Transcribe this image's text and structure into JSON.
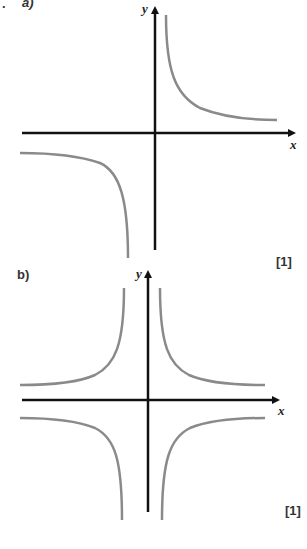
{
  "parts": [
    {
      "label": "a)",
      "prefix": ".",
      "marks": "[1]",
      "x_axis_label": "x",
      "y_axis_label": "y",
      "description": "Rectangular hyperbola y = k/x with branches in first and third quadrants"
    },
    {
      "label": "b)",
      "marks": "[1]",
      "x_axis_label": "x",
      "y_axis_label": "y",
      "description": "Graph with vertical asymptote at x=0; four branches, one in each quadrant approaching horizontal asymptotes above and below the x-axis"
    }
  ],
  "colors": {
    "axis": "#111111",
    "curve": "#8a8a8a",
    "text": "#333333"
  }
}
